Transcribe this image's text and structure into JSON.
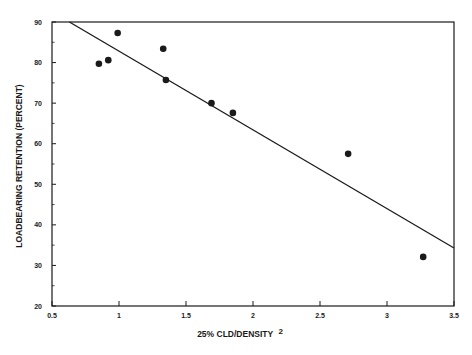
{
  "chart_data": {
    "type": "scatter",
    "title": "",
    "xlabel": "25% CLD/DENSITY",
    "xlabel_superscript": "2",
    "ylabel": "LOADBEARING RETENTION (PERCENT)",
    "xlim": [
      0.5,
      3.5
    ],
    "ylim": [
      20,
      90
    ],
    "x_ticks": [
      0.5,
      1,
      1.5,
      2,
      2.5,
      3,
      3.5
    ],
    "x_tick_labels": [
      "0.5",
      "1",
      "1.5",
      "2",
      "2.5",
      "3",
      "3.5"
    ],
    "y_ticks": [
      20,
      30,
      40,
      50,
      60,
      70,
      80,
      90
    ],
    "y_tick_labels": [
      "20",
      "30",
      "40",
      "50",
      "60",
      "70",
      "80",
      "90"
    ],
    "y_minor_ticks": [
      25,
      35,
      45,
      55,
      65,
      75,
      85
    ],
    "grid": false,
    "legend": null,
    "series": [
      {
        "name": "data points",
        "kind": "scatter",
        "marker": "filled-circle",
        "color": "#1a1a1a",
        "points": [
          {
            "x": 0.85,
            "y": 79.7
          },
          {
            "x": 0.92,
            "y": 80.6
          },
          {
            "x": 0.99,
            "y": 87.3
          },
          {
            "x": 1.33,
            "y": 83.4
          },
          {
            "x": 1.35,
            "y": 75.7
          },
          {
            "x": 1.69,
            "y": 70.0
          },
          {
            "x": 1.85,
            "y": 67.6
          },
          {
            "x": 2.71,
            "y": 57.5
          },
          {
            "x": 3.27,
            "y": 32.1
          }
        ]
      },
      {
        "name": "linear fit",
        "kind": "line",
        "color": "#1a1a1a",
        "points": [
          {
            "x": 0.63,
            "y": 90.0
          },
          {
            "x": 3.5,
            "y": 34.3
          }
        ]
      }
    ]
  },
  "layout": {
    "plot_left": 52,
    "plot_right": 454,
    "plot_top": 22,
    "plot_bottom": 306
  }
}
